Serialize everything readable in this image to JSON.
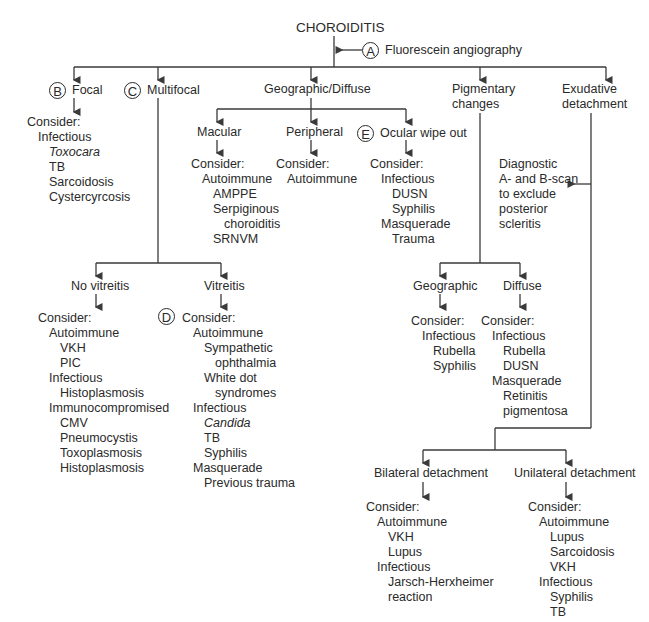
{
  "title": "CHOROIDITIS",
  "annotations": {
    "A": {
      "letter": "A",
      "label": "Fluorescein angiography"
    },
    "B": {
      "letter": "B"
    },
    "C": {
      "letter": "C"
    },
    "D": {
      "letter": "D"
    },
    "E": {
      "letter": "E"
    },
    "scan_note": [
      "Diagnostic",
      "A- and B-scan",
      "to exclude",
      "posterior",
      "scleritis"
    ]
  },
  "branches": {
    "focal": {
      "label": "Focal",
      "list": [
        "Consider:",
        "Infectious",
        "Toxocara",
        "TB",
        "Sarcoidosis",
        "Cystercyrcosis"
      ]
    },
    "multifocal": {
      "label": "Multifocal",
      "no_vitreitis": {
        "label": "No vitreitis",
        "list": [
          "Consider:",
          "Autoimmune",
          "VKH",
          "PIC",
          "Infectious",
          "Histoplasmosis",
          "Immunocompromised",
          "CMV",
          "Pneumocystis",
          "Toxoplasmosis",
          "Histoplasmosis"
        ]
      },
      "vitreitis": {
        "label": "Vitreitis",
        "list": [
          "Consider:",
          "Autoimmune",
          "Sympathetic",
          "ophthalmia",
          "White dot",
          "syndromes",
          "Infectious",
          "Candida",
          "TB",
          "Syphilis",
          "Masquerade",
          "Previous trauma"
        ]
      }
    },
    "geographic": {
      "label": "Geographic/Diffuse",
      "macular": {
        "label": "Macular",
        "list": [
          "Consider:",
          "Autoimmune",
          "AMPPE",
          "Serpiginous",
          "choroiditis",
          "SRNVM"
        ]
      },
      "peripheral": {
        "label": "Peripheral",
        "list": [
          "Consider:",
          "Autoimmune"
        ]
      },
      "ocular": {
        "label": "Ocular wipe out",
        "list": [
          "Consider:",
          "Infectious",
          "DUSN",
          "Syphilis",
          "Masquerade",
          "Trauma"
        ]
      }
    },
    "pigmentary": {
      "label1": "Pigmentary",
      "label2": "changes",
      "geographic": {
        "label": "Geographic",
        "list": [
          "Consider:",
          "Infectious",
          "Rubella",
          "Syphilis"
        ]
      },
      "diffuse": {
        "label": "Diffuse",
        "list": [
          "Consider:",
          "Infectious",
          "Rubella",
          "DUSN",
          "Masquerade",
          "Retinitis",
          "pigmentosa"
        ]
      }
    },
    "exudative": {
      "label1": "Exudative",
      "label2": "detachment",
      "bilateral": {
        "label": "Bilateral detachment",
        "list": [
          "Consider:",
          "Autoimmune",
          "VKH",
          "Lupus",
          "Infectious",
          "Jarsch-Herxheimer",
          "reaction"
        ]
      },
      "unilateral": {
        "label": "Unilateral detachment",
        "list": [
          "Consider:",
          "Autoimmune",
          "Lupus",
          "Sarcoidosis",
          "VKH",
          "Infectious",
          "Syphilis",
          "TB"
        ]
      }
    }
  }
}
